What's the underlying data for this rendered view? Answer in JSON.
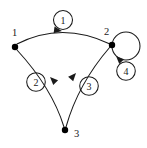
{
  "diagram": {
    "type": "directed-graph",
    "title": "Directed graph with four labeled edges",
    "canvas": {
      "width": 147,
      "height": 148,
      "background": "#ffffff"
    },
    "stroke_color": "#1a1a1a",
    "node_color": "#000000",
    "nodes": [
      {
        "id": "1",
        "label": "1",
        "x": 15,
        "y": 47,
        "radius": 3.2,
        "label_x": 12,
        "label_y": 36
      },
      {
        "id": "2",
        "label": "2",
        "x": 112,
        "y": 45,
        "radius": 3.2,
        "label_x": 104,
        "label_y": 35
      },
      {
        "id": "3",
        "label": "3",
        "x": 65,
        "y": 130,
        "radius": 3.2,
        "label_x": 74,
        "label_y": 137
      }
    ],
    "edges": [
      {
        "id": "e1",
        "label": "1",
        "from": "1",
        "to": "2",
        "path": "M 17 44 Q 62 21 110 44",
        "arrow_x": 62,
        "arrow_y": 31,
        "arrow_angle": 8,
        "label_cx": 63,
        "label_cy": 20,
        "label_r": 9.5
      },
      {
        "id": "e2",
        "label": "2",
        "from": "3",
        "to": "1",
        "path": "M 64 127 Q 52 88 17 50",
        "arrow_x": 50,
        "arrow_y": 77,
        "arrow_angle": 225,
        "label_cx": 36,
        "label_cy": 82,
        "label_r": 9.3
      },
      {
        "id": "e3",
        "label": "3",
        "from": "3",
        "to": "2",
        "path": "M 66 127 Q 78 84 110 47",
        "arrow_x": 76,
        "arrow_y": 73,
        "arrow_angle": 312,
        "label_cx": 89,
        "label_cy": 86,
        "label_r": 9.3
      },
      {
        "id": "e4",
        "label": "4",
        "from": "2",
        "to": "2",
        "self_loop": true,
        "loop_cx": 126,
        "loop_cy": 46,
        "loop_r": 14,
        "arrow_x": 116,
        "arrow_y": 56,
        "arrow_angle": 225,
        "label_cx": 126,
        "label_cy": 71,
        "label_r": 9.3
      }
    ]
  }
}
